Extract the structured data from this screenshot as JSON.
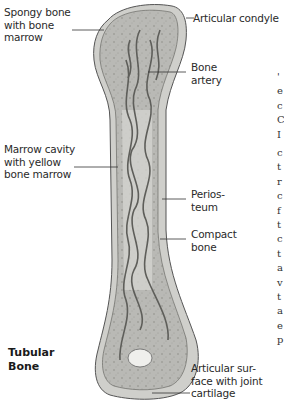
{
  "figure": {
    "title": "Tubular\nBone",
    "labels": {
      "spongy_bone": "Spongy bone\nwith bone\nmarrow",
      "articular_condyle": "Articular condyle",
      "bone_artery": "Bone\nartery",
      "marrow_cavity": "Marrow cavity\nwith yellow\nbone marrow",
      "periosteum": "Perios-\nteum",
      "compact_bone": "Compact\nbone",
      "articular_surface": "Articular sur-\nface with joint\ncartilage"
    }
  },
  "adjacent_text_fragment": {
    "top": "'\ne\nc\nC\nI",
    "bottom": "c\nt\nr\nc\nf\nt\nc\nt\na\nv\nt\na\ne\np"
  }
}
